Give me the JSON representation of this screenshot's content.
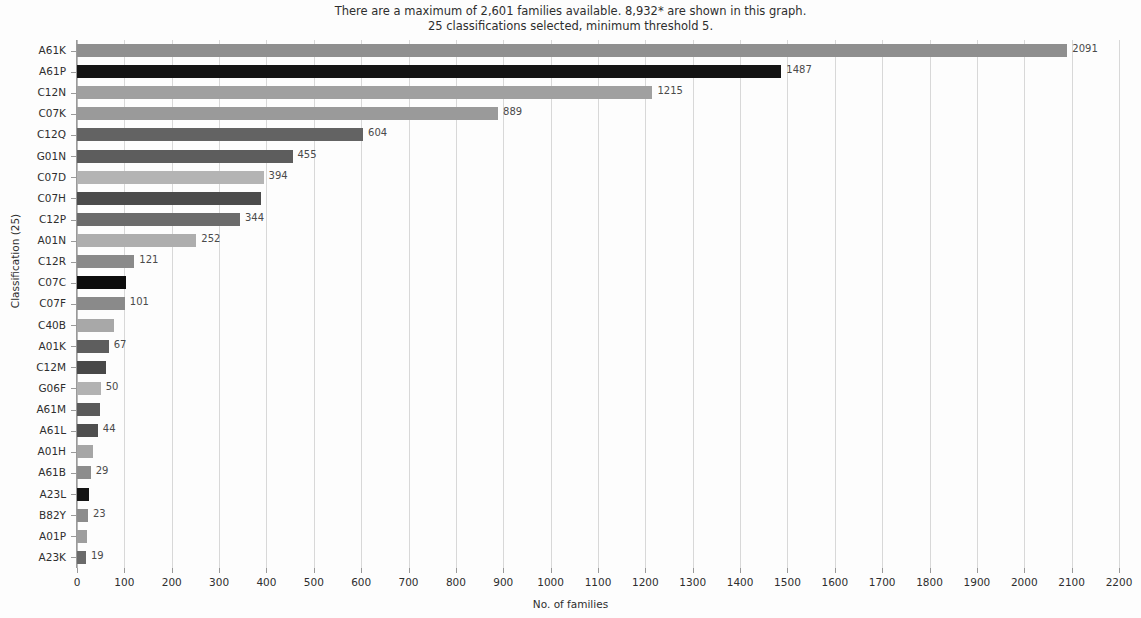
{
  "header": {
    "line1": "There are a maximum of 2,601 families available. 8,932* are shown in this graph.",
    "line2": "25 classifications selected, minimum threshold 5."
  },
  "chart_data": {
    "type": "bar",
    "orientation": "horizontal",
    "title": "There are a maximum of 2,601 families available. 8,932* are shown in this graph. 25 classifications selected, minimum threshold 5.",
    "xlabel": "No. of families",
    "ylabel": "Classification (25)",
    "xlim": [
      0,
      2200
    ],
    "xticks": [
      0,
      100,
      200,
      300,
      400,
      500,
      600,
      700,
      800,
      900,
      1000,
      1100,
      1200,
      1300,
      1400,
      1500,
      1600,
      1700,
      1800,
      1900,
      2000,
      2100,
      2200
    ],
    "grid": true,
    "legend": "none",
    "categories": [
      "A61K",
      "A61P",
      "C12N",
      "C07K",
      "C12Q",
      "G01N",
      "C07D",
      "C07H",
      "C12P",
      "A01N",
      "C12R",
      "C07C",
      "C07F",
      "C40B",
      "A01K",
      "C12M",
      "G06F",
      "A61M",
      "A61L",
      "A01H",
      "A61B",
      "A23L",
      "B82Y",
      "A01P",
      "A23K"
    ],
    "values": [
      2091,
      1487,
      1215,
      889,
      604,
      455,
      394,
      388,
      344,
      252,
      121,
      104,
      101,
      79,
      67,
      61,
      50,
      48,
      44,
      34,
      29,
      26,
      23,
      21,
      19
    ],
    "bar_colors": [
      "#8f8f8f",
      "#141414",
      "#a0a0a0",
      "#9a9a9a",
      "#636363",
      "#5d5d5d",
      "#b4b4b4",
      "#4b4b4b",
      "#6b6b6b",
      "#aeaeae",
      "#8a8a8a",
      "#0d0d0d",
      "#8a8a8a",
      "#a8a8a8",
      "#5e5e5e",
      "#484848",
      "#b2b2b2",
      "#5a5a5a",
      "#4f4f4f",
      "#a6a6a6",
      "#8d8d8d",
      "#141414",
      "#8c8c8c",
      "#9e9e9e",
      "#6a6a6a"
    ],
    "value_labels": [
      "2091",
      "1487",
      "1215",
      "889",
      "604",
      "455",
      "394",
      "",
      "344",
      "252",
      "121",
      "",
      "101",
      "",
      "67",
      "",
      "50",
      "",
      "44",
      "",
      "29",
      "",
      "23",
      "",
      "19"
    ]
  }
}
